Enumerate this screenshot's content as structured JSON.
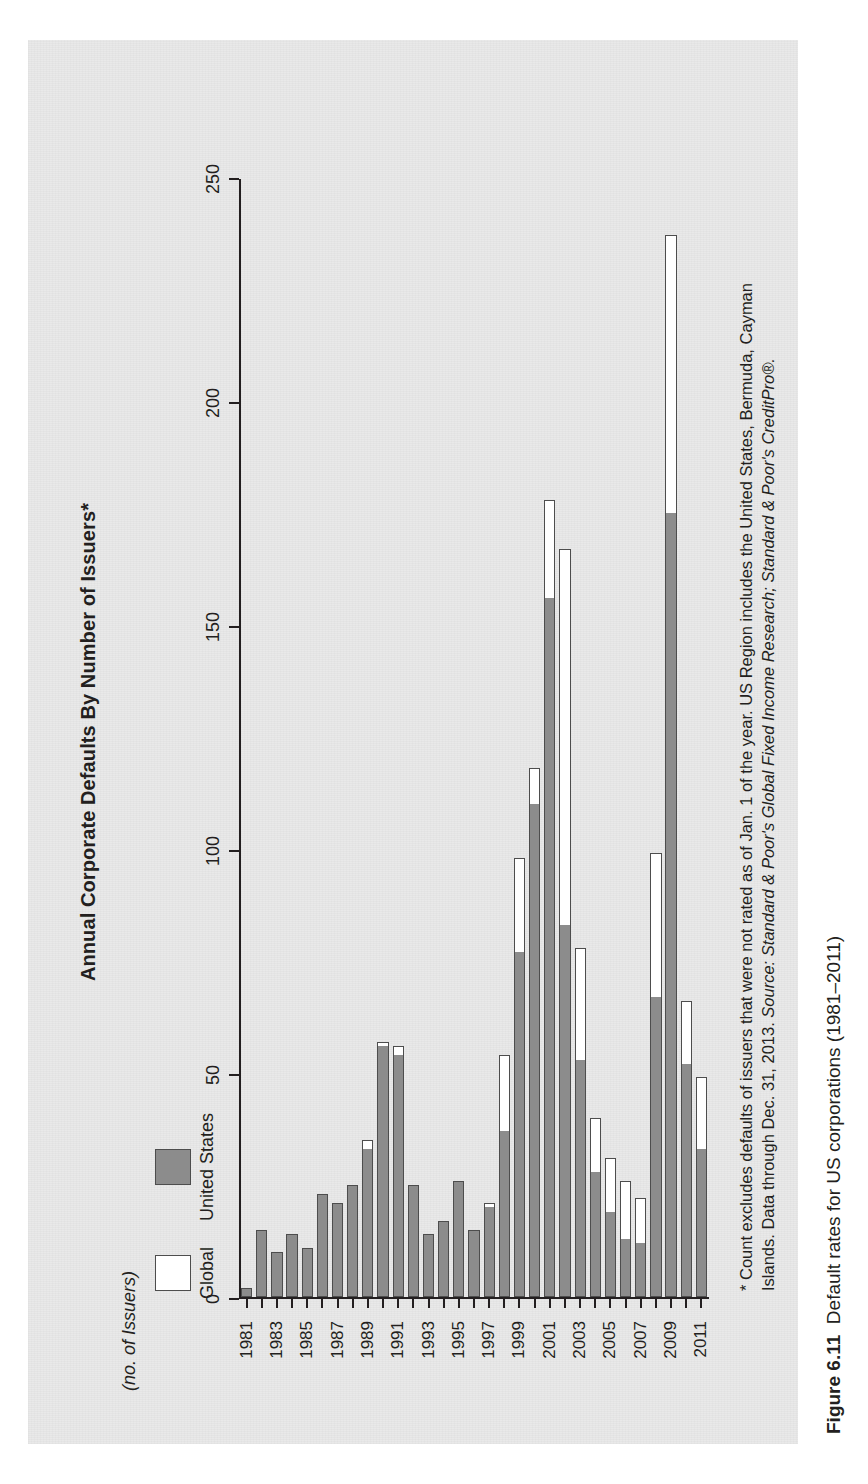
{
  "figure": {
    "caption_label": "Figure 6.11",
    "caption_text": "Default rates for US corporations (1981–2011)"
  },
  "chart_data": {
    "type": "bar",
    "orientation": "horizontal",
    "stacked": true,
    "title": "Annual Corporate Defaults By Number of Issuers*",
    "xlabel": "",
    "ylabel": "(no. of Issuers)",
    "xlim": [
      0,
      250
    ],
    "xticks": [
      0,
      50,
      100,
      150,
      200,
      250
    ],
    "grid": false,
    "legend_position": "top-left",
    "legend": [
      "Global",
      "United States"
    ],
    "colors": {
      "global": "#ffffff",
      "united_states": "#8c8c8c",
      "outline": "#4d4d4d",
      "text": "#231f20",
      "paper": "#e9e9e9"
    },
    "categories": [
      1981,
      1982,
      1983,
      1984,
      1985,
      1986,
      1987,
      1988,
      1989,
      1990,
      1991,
      1992,
      1993,
      1994,
      1995,
      1996,
      1997,
      1998,
      1999,
      2000,
      2001,
      2002,
      2003,
      2004,
      2005,
      2006,
      2007,
      2008,
      2009,
      2010,
      2011
    ],
    "tick_labels": [
      "1981",
      "",
      "1983",
      "",
      "1985",
      "",
      "1987",
      "",
      "1989",
      "",
      "1991",
      "",
      "1993",
      "",
      "1995",
      "",
      "1997",
      "",
      "1999",
      "",
      "2001",
      "",
      "2003",
      "",
      "2005",
      "",
      "2007",
      "",
      "2009",
      "",
      "2011"
    ],
    "series": [
      {
        "name": "United States",
        "values": [
          2,
          15,
          10,
          14,
          11,
          23,
          21,
          25,
          33,
          56,
          54,
          25,
          14,
          17,
          26,
          15,
          20,
          37,
          77,
          110,
          156,
          83,
          53,
          28,
          19,
          13,
          12,
          67,
          175,
          52,
          33
        ]
      },
      {
        "name": "Global",
        "values": [
          2,
          15,
          10,
          14,
          11,
          23,
          21,
          25,
          35,
          57,
          56,
          25,
          14,
          17,
          26,
          15,
          21,
          54,
          98,
          118,
          178,
          167,
          78,
          40,
          31,
          26,
          22,
          99,
          237,
          66,
          49
        ]
      }
    ]
  },
  "footnote": {
    "line1": "* Count excludes defaults of issuers that were not rated as of Jan. 1 of the year. US Region includes the United States, Bermuda, Cayman",
    "line2_plain": "Islands. Data through Dec. 31, 2013. ",
    "line2_italic": "Source: Standard & Poor's Global Fixed Income Research; Standard & Poor's CreditPro®."
  }
}
